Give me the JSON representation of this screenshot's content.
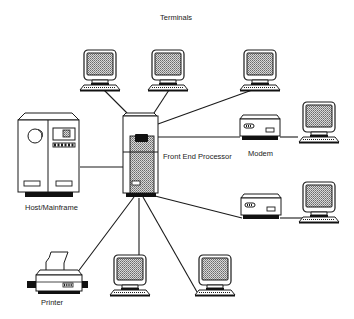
{
  "diagram": {
    "type": "network-topology",
    "labels": {
      "terminals": "Terminals",
      "host": "Host/Mainframe",
      "fep": "Front End Processor",
      "modem": "Modem",
      "printer": "Printer"
    },
    "nodes": [
      {
        "id": "fep",
        "kind": "front-end-processor",
        "label": "Front End Processor"
      },
      {
        "id": "host",
        "kind": "mainframe",
        "label": "Host/Mainframe"
      },
      {
        "id": "term-top-1",
        "kind": "terminal"
      },
      {
        "id": "term-top-2",
        "kind": "terminal"
      },
      {
        "id": "term-top-3",
        "kind": "terminal"
      },
      {
        "id": "modem-1",
        "kind": "modem",
        "label": "Modem"
      },
      {
        "id": "term-right-1",
        "kind": "terminal"
      },
      {
        "id": "modem-2",
        "kind": "modem"
      },
      {
        "id": "term-right-2",
        "kind": "terminal"
      },
      {
        "id": "printer",
        "kind": "printer",
        "label": "Printer"
      },
      {
        "id": "term-bottom-1",
        "kind": "terminal"
      },
      {
        "id": "term-bottom-2",
        "kind": "terminal"
      }
    ],
    "edges": [
      [
        "fep",
        "host"
      ],
      [
        "fep",
        "term-top-1"
      ],
      [
        "fep",
        "term-top-2"
      ],
      [
        "fep",
        "term-top-3"
      ],
      [
        "fep",
        "modem-1"
      ],
      [
        "modem-1",
        "term-right-1"
      ],
      [
        "fep",
        "modem-2"
      ],
      [
        "modem-2",
        "term-right-2"
      ],
      [
        "fep",
        "printer"
      ],
      [
        "fep",
        "term-bottom-1"
      ],
      [
        "fep",
        "term-bottom-2"
      ]
    ],
    "colors": {
      "line": "#1a1a1a",
      "fill": "#ffffff",
      "screen": "#bdbdbd",
      "dark": "#111111"
    }
  }
}
